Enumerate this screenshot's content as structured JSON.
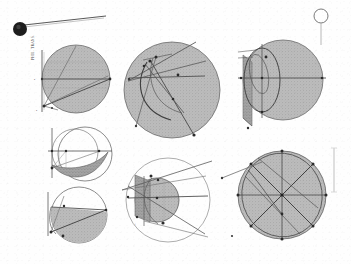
{
  "plate": {
    "medium": "scanned engraved plate",
    "background_color": "#fefefe",
    "ink_color": "#4a4a4a",
    "shade_fill_color": "#b7b7b7",
    "shade_fill_dark_color": "#9a9a9a",
    "caption_vertical": "PHIL. TRANS.",
    "figure_count": 7
  },
  "marks": {
    "ink_blot": {
      "name": "ink-blot-with-rule-line",
      "color": "#1d1d1d",
      "cx": 20,
      "cy": 29,
      "r": 7
    },
    "small_circle_top_right": {
      "name": "small-open-circle",
      "cx": 321,
      "cy": 16,
      "r": 7,
      "stem_label": "1"
    },
    "right_edge_scale": {
      "name": "margin-scale-line",
      "x": 334,
      "y": 148,
      "height": 44
    }
  },
  "figures": [
    {
      "id": "fig-1",
      "label": "1",
      "position": "top-left",
      "type": "shaded-circle-with-axis",
      "cx": 76,
      "cy": 79,
      "r": 34,
      "shaded": true,
      "points": [
        "A",
        "B",
        "C",
        "D",
        "E"
      ],
      "point_labels_side": "left",
      "has_vertical_axis": true,
      "has_horizontal_diameter": true,
      "ray_count": 3
    },
    {
      "id": "fig-2",
      "label": "2",
      "position": "top-center",
      "type": "shaded-circle-with-arcs",
      "cx": 172,
      "cy": 90,
      "r": 48,
      "shaded": true,
      "points": [
        "A",
        "B",
        "C",
        "D",
        "E",
        "F",
        "G",
        "H"
      ],
      "arc_count": 2,
      "chord_count": 4,
      "tangent_rays": 2
    },
    {
      "id": "fig-3",
      "label": "3",
      "position": "top-right",
      "type": "shaded-circle-with-ellipses",
      "cx": 283,
      "cy": 80,
      "r": 40,
      "shaded": true,
      "ellipse_count": 2,
      "has_left_wedge": true,
      "points": [
        "A",
        "B",
        "C",
        "D",
        "E"
      ]
    },
    {
      "id": "fig-4",
      "label": "4",
      "position": "middle-left",
      "type": "twin-circles-with-lens",
      "cx": 79,
      "cy": 154,
      "r": 27,
      "shaded": false,
      "second_circle_offset": -8,
      "lens_shaded": true,
      "points": [
        "A",
        "B",
        "C",
        "D"
      ]
    },
    {
      "id": "fig-5",
      "label": "5",
      "position": "bottom-left",
      "type": "circle-with-shaded-segment",
      "cx": 79,
      "cy": 215,
      "r": 28,
      "shaded": false,
      "segment_shaded": true,
      "points": [
        "A",
        "B",
        "C"
      ]
    },
    {
      "id": "fig-6",
      "label": "6",
      "position": "bottom-center",
      "type": "inner-shaded-circle-in-outer-circle",
      "cx": 168,
      "cy": 200,
      "r": 42,
      "inner_r": 22,
      "inner_cx": 157,
      "inner_cy": 200,
      "shaded": false,
      "inner_shaded": true,
      "has_left_block": true,
      "points": [
        "A",
        "B",
        "C",
        "D",
        "E"
      ]
    },
    {
      "id": "fig-7",
      "label": "7",
      "position": "bottom-right",
      "type": "shaded-circle-star-chords",
      "cx": 282,
      "cy": 195,
      "r": 44,
      "shaded": true,
      "radial_count": 8,
      "chord_count": 6,
      "inscribed_ellipse": true,
      "points": [
        "A",
        "B",
        "C",
        "D",
        "E",
        "F",
        "G",
        "H",
        "I"
      ]
    }
  ]
}
